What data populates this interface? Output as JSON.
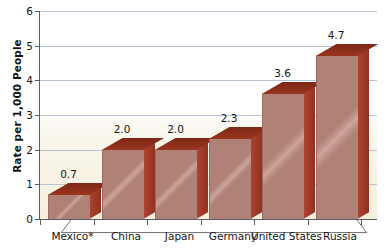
{
  "chart_data": {
    "type": "bar",
    "title": "",
    "subtitle": "",
    "xlabel": "",
    "ylabel": "Rate per 1,000 People",
    "categories": [
      "Mexico*",
      "China",
      "Japan",
      "Germany",
      "United States",
      "Russia"
    ],
    "values": [
      0.7,
      2.0,
      2.0,
      2.3,
      3.6,
      4.7
    ],
    "value_labels": [
      "0.7",
      "2.0",
      "2.0",
      "2.3",
      "3.6",
      "4.7"
    ],
    "ylim": [
      0,
      6
    ],
    "ytick_labels": [
      "0",
      "1",
      "2",
      "3",
      "4",
      "5",
      "6"
    ],
    "ytick_values": [
      0,
      1,
      2,
      3,
      4,
      5,
      6
    ],
    "grid": true,
    "grid_axis": "y",
    "legend": false,
    "legend_position": "none",
    "series": [
      {
        "name": "Rate per 1,000 People",
        "values": [
          0.7,
          2.0,
          2.0,
          2.3,
          3.6,
          4.7
        ]
      }
    ],
    "style": "3d-column",
    "colors": {
      "bar_front": "#b08277",
      "bar_side": "#a03a28",
      "bar_top": "#8e2f1e",
      "gridline": "#b9c4d2",
      "axis": "#5d5d5d",
      "plot_tint": "#f3ecd6",
      "text": "#141414",
      "background": "#ffffff"
    }
  }
}
